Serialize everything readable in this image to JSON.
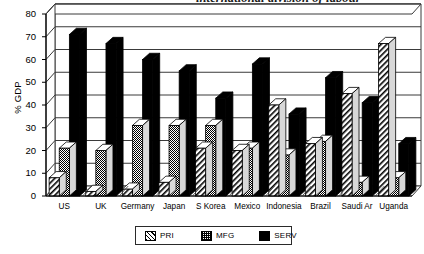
{
  "title": {
    "text": "international division of labour",
    "note": "cropped at top edge of screenshot"
  },
  "axes": {
    "ylabel": "% GDP",
    "yticks": [
      0,
      10,
      20,
      30,
      40,
      50,
      60,
      70,
      80
    ],
    "ymin": 0,
    "ymax": 80
  },
  "legend": {
    "position": "bottom-center",
    "entries": [
      {
        "label": "PRI",
        "pattern": "diagonal-hatch",
        "color": "#000000"
      },
      {
        "label": "MFG",
        "pattern": "checker-stipple",
        "color": "#000000"
      },
      {
        "label": "SERV",
        "pattern": "solid",
        "color": "#000000"
      }
    ]
  },
  "chart_data": {
    "type": "bar",
    "title": "international division of labour",
    "xlabel": "",
    "ylabel": "% GDP",
    "ylim": [
      0,
      80
    ],
    "grid": true,
    "categories": [
      "US",
      "UK",
      "Germany",
      "Japan",
      "S Korea",
      "Mexico",
      "Indonesia",
      "Brazil",
      "Saudi Ar",
      "Uganda"
    ],
    "series": [
      {
        "name": "PRI",
        "values": [
          8,
          2,
          3,
          6,
          21,
          20,
          40,
          23,
          45,
          67
        ]
      },
      {
        "name": "MFG",
        "values": [
          21,
          20,
          31,
          31,
          31,
          21,
          18,
          24,
          6,
          8
        ]
      },
      {
        "name": "SERV",
        "values": [
          71,
          67,
          60,
          55,
          43,
          58,
          36,
          52,
          41,
          23
        ]
      }
    ]
  }
}
